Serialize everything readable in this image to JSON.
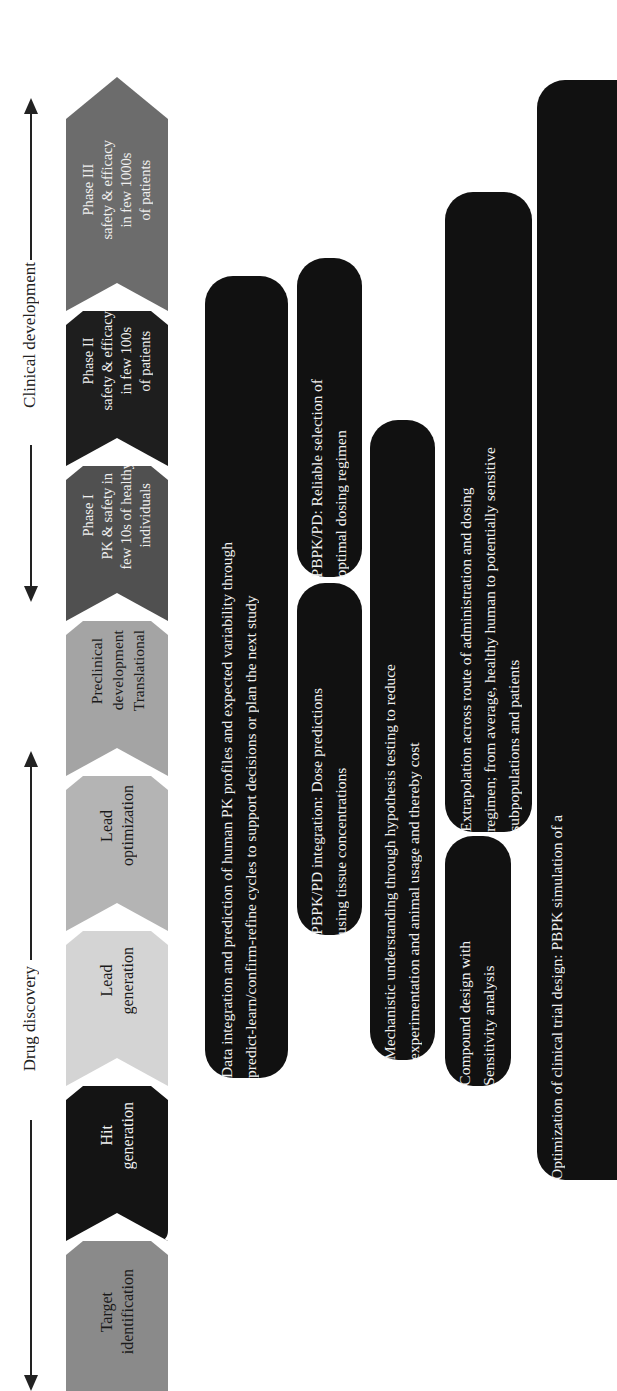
{
  "diagram": {
    "orientation": "rotated-90-ccw",
    "phase_groups": [
      {
        "label": "Drug discovery"
      },
      {
        "label": "Clinical development"
      }
    ],
    "stages": [
      {
        "label": "Target\nidentification",
        "color": "#8a8a8a",
        "text_color": "#1a1a1a"
      },
      {
        "label": "Hit\ngeneration",
        "color": "#141414",
        "text_color": "#f0f0f0"
      },
      {
        "label": "Lead\ngeneration",
        "color": "#d4d4d4",
        "text_color": "#1a1a1a"
      },
      {
        "label": "Lead\noptimization",
        "color": "#b4b4b4",
        "text_color": "#1a1a1a"
      },
      {
        "label": "Preclinical\ndevelopment\nTranslational",
        "color": "#a4a4a4",
        "text_color": "#1a1a1a"
      },
      {
        "label": "Phase I\nPK & safety in\nfew 10s of healthy\nindividuals",
        "color": "#505050",
        "text_color": "#f0f0f0"
      },
      {
        "label": "Phase II\nsafety & efficacy\nin few 100s\nof patients",
        "color": "#1e1e1e",
        "text_color": "#f0f0f0"
      },
      {
        "label": "Phase III\nsafety & efficacy\nin few 1000s\nof patients",
        "color": "#6c6c6c",
        "text_color": "#f0f0f0"
      }
    ],
    "applications": [
      {
        "text": "Data integration and prediction of human PK profiles and expected variability through\npredict-learn/confirm-refine cycles to support decisions or plan the next study"
      },
      {
        "text": "PBPK/PD integration: Dose predictions\nusing tissue concentrations"
      },
      {
        "text": "PBPK/PD: Reliable selection of\noptimal dosing regimen"
      },
      {
        "text": "Mechanistic understanding through hypothesis testing to reduce\nexperimentation and animal usage and thereby cost"
      },
      {
        "text": "Compound design with\nSensitivity analysis"
      },
      {
        "text": "Extrapolation across route of administration and dosing\nregimen; from average, healthy human to potentially sensitive\nsubpopulations and patients"
      },
      {
        "text": "Optimization of clinical trial design: PBPK simulation of a"
      }
    ]
  }
}
